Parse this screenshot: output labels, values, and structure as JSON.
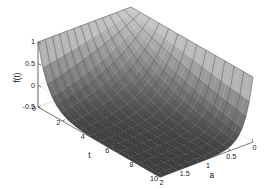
{
  "figure": {
    "kind": "matlab-3d-surface-plot",
    "background_color": "#ffffff",
    "surface_dark_color": "#3f3f3f",
    "surface_light_color": "#c4c4c4",
    "mesh_color": "#2b2b2b",
    "axis_color": "#4d4d4d",
    "grid_color": "#c8c8c8"
  },
  "chart_data": {
    "type": "surface",
    "title": "",
    "xlabel": "a",
    "ylabel": "t",
    "zlabel": "f(t)",
    "xlim": [
      2,
      0
    ],
    "ylim": [
      0,
      10
    ],
    "zlim": [
      -0.5,
      1
    ],
    "xticks": [
      "2",
      "1.5",
      "1",
      "0.5",
      "0"
    ],
    "xtick_values": [
      2,
      1.5,
      1,
      0.5,
      0
    ],
    "yticks": [
      "0",
      "2",
      "4",
      "6",
      "8",
      "10"
    ],
    "ytick_values": [
      0,
      2,
      4,
      6,
      8,
      10
    ],
    "zticks": [
      "1",
      "0.5",
      "0",
      "-0.5"
    ],
    "ztick_values": [
      1,
      0.5,
      0,
      -0.5
    ],
    "grid": true,
    "legend": null,
    "colormap": "gray",
    "x_name": "a",
    "y_name": "t",
    "z_name": "f(t)",
    "nx": 13,
    "ny": 13,
    "z_values": [
      [
        1.0,
        0.98,
        0.95,
        0.88,
        0.74,
        0.56,
        0.34,
        0.12,
        -0.08,
        -0.24,
        -0.36,
        -0.44,
        -0.48
      ],
      [
        1.0,
        0.97,
        0.92,
        0.83,
        0.68,
        0.49,
        0.27,
        0.06,
        -0.13,
        -0.28,
        -0.39,
        -0.46,
        -0.49
      ],
      [
        1.0,
        0.96,
        0.89,
        0.78,
        0.61,
        0.41,
        0.19,
        -0.01,
        -0.19,
        -0.33,
        -0.42,
        -0.47,
        -0.5
      ],
      [
        1.0,
        0.95,
        0.85,
        0.71,
        0.52,
        0.31,
        0.1,
        -0.09,
        -0.25,
        -0.37,
        -0.45,
        -0.49,
        -0.5
      ],
      [
        1.0,
        0.93,
        0.8,
        0.63,
        0.42,
        0.2,
        0.0,
        -0.17,
        -0.31,
        -0.41,
        -0.47,
        -0.5,
        -0.5
      ],
      [
        1.0,
        0.91,
        0.74,
        0.54,
        0.31,
        0.09,
        -0.1,
        -0.25,
        -0.37,
        -0.44,
        -0.48,
        -0.5,
        -0.5
      ],
      [
        1.0,
        0.88,
        0.67,
        0.43,
        0.19,
        -0.02,
        -0.2,
        -0.33,
        -0.42,
        -0.47,
        -0.5,
        -0.5,
        -0.5
      ],
      [
        1.0,
        0.84,
        0.58,
        0.31,
        0.07,
        -0.14,
        -0.29,
        -0.39,
        -0.45,
        -0.49,
        -0.5,
        -0.5,
        -0.5
      ],
      [
        1.0,
        0.79,
        0.48,
        0.19,
        -0.05,
        -0.24,
        -0.37,
        -0.44,
        -0.48,
        -0.5,
        -0.5,
        -0.5,
        -0.5
      ],
      [
        1.0,
        0.73,
        0.37,
        0.07,
        -0.16,
        -0.33,
        -0.43,
        -0.48,
        -0.5,
        -0.5,
        -0.5,
        -0.5,
        -0.5
      ],
      [
        1.0,
        0.65,
        0.25,
        -0.05,
        -0.27,
        -0.4,
        -0.47,
        -0.5,
        -0.5,
        -0.5,
        -0.5,
        -0.5,
        -0.5
      ],
      [
        1.0,
        0.56,
        0.12,
        -0.17,
        -0.36,
        -0.46,
        -0.5,
        -0.5,
        -0.5,
        -0.5,
        -0.5,
        -0.5,
        -0.5
      ],
      [
        1.0,
        0.45,
        -0.01,
        -0.28,
        -0.43,
        -0.49,
        -0.5,
        -0.5,
        -0.5,
        -0.5,
        -0.5,
        -0.5,
        -0.5
      ]
    ]
  }
}
